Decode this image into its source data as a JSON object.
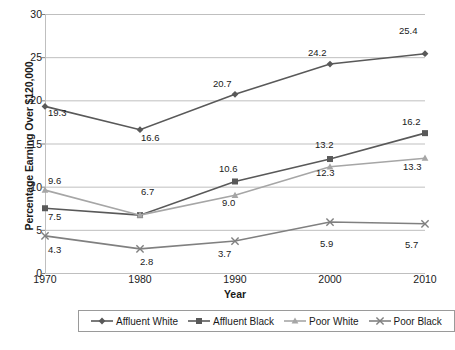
{
  "chart_data": {
    "type": "line",
    "title": "",
    "xlabel": "Year",
    "ylabel": "Percentage Earning Over $120,000",
    "categories": [
      "1970",
      "1980",
      "1990",
      "2000",
      "2010"
    ],
    "x": [
      1970,
      1980,
      1990,
      2000,
      2010
    ],
    "xlim": [
      1970,
      2010
    ],
    "ylim": [
      0,
      30
    ],
    "yticks": [
      0,
      5,
      10,
      15,
      20,
      25,
      30
    ],
    "grid": "horizontal",
    "legend_position": "bottom",
    "series": [
      {
        "name": "Affluent White",
        "marker": "diamond",
        "color": "#595959",
        "values": [
          19.3,
          16.6,
          20.7,
          24.2,
          25.4
        ],
        "labels": [
          "19.3",
          "16.6",
          "20.7",
          "24.2",
          "25.4"
        ]
      },
      {
        "name": "Affluent Black",
        "marker": "square",
        "color": "#595959",
        "values": [
          7.5,
          6.7,
          10.6,
          13.2,
          16.2
        ],
        "labels": [
          "7.5",
          "6.7",
          "10.6",
          "13.2",
          "16.2"
        ]
      },
      {
        "name": "Poor White",
        "marker": "triangle",
        "color": "#a6a6a6",
        "values": [
          9.6,
          6.7,
          9.0,
          12.3,
          13.3
        ],
        "labels": [
          "9.6",
          "6.7",
          "9.0",
          "12.3",
          "13.3"
        ]
      },
      {
        "name": "Poor Black",
        "marker": "x",
        "color": "#808080",
        "values": [
          4.3,
          2.8,
          3.7,
          5.9,
          5.7
        ],
        "labels": [
          "4.3",
          "2.8",
          "3.7",
          "5.9",
          "5.7"
        ]
      }
    ]
  },
  "axes": {
    "y_tick_labels": [
      "30",
      "25",
      "20",
      "15",
      "10",
      "5",
      "0"
    ],
    "x_tick_labels": [
      "1970",
      "1980",
      "1990",
      "2000",
      "2010"
    ],
    "y_title": "Percentage Earning Over $120,000",
    "x_title": "Year"
  },
  "legend": {
    "items": [
      {
        "label": "Affluent White"
      },
      {
        "label": "Affluent Black"
      },
      {
        "label": "Poor White"
      },
      {
        "label": "Poor Black"
      }
    ]
  },
  "data_labels": [
    {
      "text": "19.3",
      "x": 48,
      "y": 108
    },
    {
      "text": "16.6",
      "x": 141,
      "y": 133
    },
    {
      "text": "20.7",
      "x": 213,
      "y": 79
    },
    {
      "text": "24.2",
      "x": 308,
      "y": 48
    },
    {
      "text": "25.4",
      "x": 399,
      "y": 26
    },
    {
      "text": "7.5",
      "x": 48,
      "y": 212
    },
    {
      "text": "6.7",
      "x": 141,
      "y": 187
    },
    {
      "text": "10.6",
      "x": 219,
      "y": 164
    },
    {
      "text": "13.2",
      "x": 315,
      "y": 140
    },
    {
      "text": "16.2",
      "x": 402,
      "y": 117
    },
    {
      "text": "9.6",
      "x": 48,
      "y": 176
    },
    {
      "text": "9.0",
      "x": 222,
      "y": 198
    },
    {
      "text": "12.3",
      "x": 316,
      "y": 168
    },
    {
      "text": "13.3",
      "x": 403,
      "y": 162
    },
    {
      "text": "4.3",
      "x": 48,
      "y": 245
    },
    {
      "text": "2.8",
      "x": 140,
      "y": 257
    },
    {
      "text": "3.7",
      "x": 218,
      "y": 249
    },
    {
      "text": "5.9",
      "x": 320,
      "y": 239
    },
    {
      "text": "5.7",
      "x": 405,
      "y": 240
    }
  ]
}
